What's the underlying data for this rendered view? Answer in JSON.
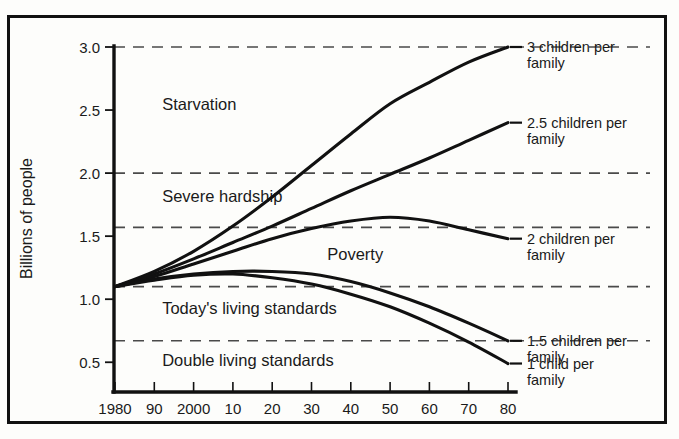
{
  "chart_data": {
    "type": "line",
    "title": "",
    "xlabel": "",
    "ylabel": "Billions of people",
    "xlim": [
      1980,
      2082
    ],
    "ylim": [
      0.28,
      3.0
    ],
    "grid": "horizontal-dashed",
    "legend_position": "right-of-curve-ends",
    "x_tick_labels": [
      "1980",
      "90",
      "2000",
      "10",
      "20",
      "30",
      "40",
      "50",
      "60",
      "70",
      "80"
    ],
    "x_tick_values": [
      1980,
      1990,
      2000,
      2010,
      2020,
      2030,
      2040,
      2050,
      2060,
      2070,
      2080
    ],
    "y_tick_labels": [
      "3.0",
      "2.5",
      "2.0",
      "1.5",
      "1.0",
      "0.5"
    ],
    "y_tick_values": [
      3.0,
      2.5,
      2.0,
      1.5,
      1.0,
      0.5
    ],
    "gridlines": [
      3.0,
      2.0,
      1.57,
      1.1,
      0.67
    ],
    "band_labels": [
      {
        "text": "Starvation",
        "x": 1992,
        "y": 2.55
      },
      {
        "text": "Severe hardship",
        "x": 1992,
        "y": 1.82
      },
      {
        "text": "Poverty",
        "x": 2034,
        "y": 1.36
      },
      {
        "text": "Today's living standards",
        "x": 1992,
        "y": 0.93
      },
      {
        "text": "Double living standards",
        "x": 1992,
        "y": 0.52
      }
    ],
    "x": [
      1980,
      1990,
      2000,
      2010,
      2020,
      2030,
      2040,
      2050,
      2060,
      2070,
      2080
    ],
    "series": [
      {
        "name": "3 children per family",
        "label_lines": [
          "3 children per",
          "family"
        ],
        "values": [
          1.1,
          1.22,
          1.38,
          1.58,
          1.81,
          2.06,
          2.31,
          2.55,
          2.72,
          2.88,
          3.0
        ],
        "label_anchor_y": 3.0
      },
      {
        "name": "2.5 children per family",
        "label_lines": [
          "2.5 children per",
          "family"
        ],
        "values": [
          1.1,
          1.2,
          1.32,
          1.45,
          1.58,
          1.72,
          1.86,
          1.99,
          2.12,
          2.26,
          2.4
        ],
        "label_anchor_y": 2.4
      },
      {
        "name": "2 children per family",
        "label_lines": [
          "2 children per",
          "family"
        ],
        "values": [
          1.1,
          1.18,
          1.28,
          1.38,
          1.48,
          1.56,
          1.62,
          1.65,
          1.62,
          1.55,
          1.48
        ],
        "label_anchor_y": 1.48
      },
      {
        "name": "1.5 children per family",
        "label_lines": [
          "1.5 children per",
          "family"
        ],
        "values": [
          1.1,
          1.16,
          1.2,
          1.22,
          1.22,
          1.2,
          1.14,
          1.05,
          0.94,
          0.81,
          0.67
        ],
        "label_anchor_y": 0.67
      },
      {
        "name": "1 child per family",
        "label_lines": [
          "1 child per",
          "family"
        ],
        "values": [
          1.1,
          1.15,
          1.19,
          1.2,
          1.17,
          1.12,
          1.04,
          0.94,
          0.81,
          0.66,
          0.49
        ],
        "label_anchor_y": 0.49
      }
    ],
    "colors": {
      "line": "#111111",
      "axis": "#111111",
      "grid": "#4a4a4a",
      "background": "#fdfdfb",
      "text": "#1a1a1a"
    }
  }
}
